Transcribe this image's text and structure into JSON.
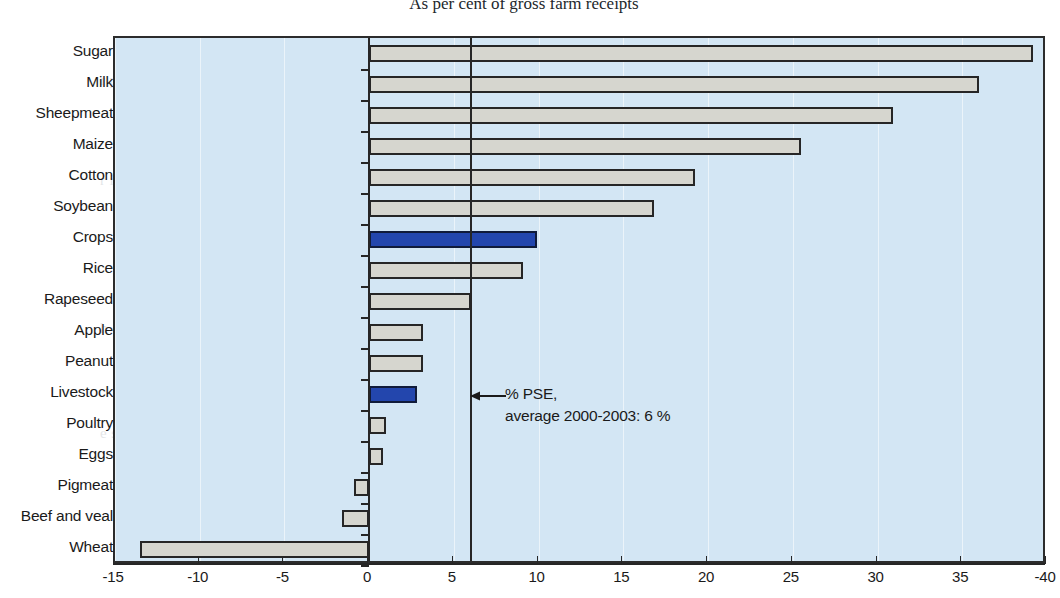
{
  "chart_data": {
    "type": "bar",
    "orientation": "horizontal",
    "title": "As per cent of gross farm receipts",
    "xlabel": "",
    "ylabel": "",
    "xlim": [
      -15,
      40
    ],
    "xticks": [
      -15,
      -10,
      -5,
      0,
      5,
      10,
      15,
      20,
      25,
      30,
      35,
      -40
    ],
    "grid": "vertical",
    "legend": "none",
    "categories": [
      "Sugar",
      "Milk",
      "Sheepmeat",
      "Maize",
      "Cotton",
      "Soybean",
      "Crops",
      "Rice",
      "Rapeseed",
      "Apple",
      "Peanut",
      "Livestock",
      "Poultry",
      "Eggs",
      "Pigmeat",
      "Beef and veal",
      "Wheat"
    ],
    "values": [
      39.2,
      36.0,
      30.9,
      25.5,
      19.2,
      16.8,
      9.9,
      9.1,
      6.0,
      3.2,
      3.2,
      2.8,
      1.0,
      0.8,
      -0.9,
      -1.6,
      -13.5
    ],
    "highlight_categories": [
      "Crops",
      "Livestock"
    ],
    "reference_line": {
      "value": 6,
      "label_line1": "% PSE,",
      "label_line2": "average 2000-2003: 6 %"
    },
    "colors": {
      "bar_default": "#d6d6cf",
      "bar_highlight": "#2346ad",
      "bar_outline": "#262626",
      "plot_background": "#d3e6f4",
      "axis": "#262626"
    }
  },
  "axis": {
    "tick_labels": [
      "-15",
      "-10",
      "-5",
      "0",
      "5",
      "10",
      "15",
      "20",
      "25",
      "30",
      "35",
      "-40"
    ]
  },
  "annotation": {
    "line1": "% PSE,",
    "line2": "average 2000-2003: 6 %"
  },
  "page_background_text": {
    "lines": [
      "e  s  w  y  s  u  i  d  h  a  r  e  s  u  c  h  a  t  o  u  g  h  o  n  e",
      "r  p  l  i  n  g     t  h  e    m  o  s  t      b  a  s  i  c       o  f        t  h  e",
      "e  t  o  w  a  r  d  s  u  p  p  o  r  t  i  n  g     t  h  e     w  e  a  k     s  t  o",
      "n  s  i  d  e  r  t  h  e      m  i  g  r  a  t  i  o  n         i  t     f  o  u  n  d      t",
      "r  i  m  p  o  s  e  d     o  n  t  h  e     w  h  o  l  e         s  e  c  t  o  r  y",
      "d  u  s  t  r  i  a  l  s  t  r  u  c  t  u  r  e  s    r  e  q  u  i  r  e",
      "R  u  r  a  l   n  e  t  w  o  r  k   d  e  v  e  l  o  p  m",
      "h  e   c  h  a  n  n  e  l  s     t  h  r  o  u  g  h   t  h  e      r  u  r  a  l   a  r",
      "u  n  a  b  l  e    t  o    f  i  t    t  h  e    p  a  t  t  e  r  n       r  e  q  u  i  r  e  s  b",
      "h  e  n   t  h  e  y   s  h  o  u  l  d   b  e  c  o  m  e   h  i  g  h  e  r   f  o  r   r  e  c  l  a  m  a  t",
      "e  s   t  h  e  i  r   c  h  a  n  g  e  s   m  o  r  e       c  o  m  p  e  t  i  t  i  o  n    t  h  e  r",
      "i  t  h   r  e  s  p  e  c  t   t  o   t  h  e   g  r  o  w  t  h   o  f   t  h  e   v  a  l  u  e"
    ]
  }
}
